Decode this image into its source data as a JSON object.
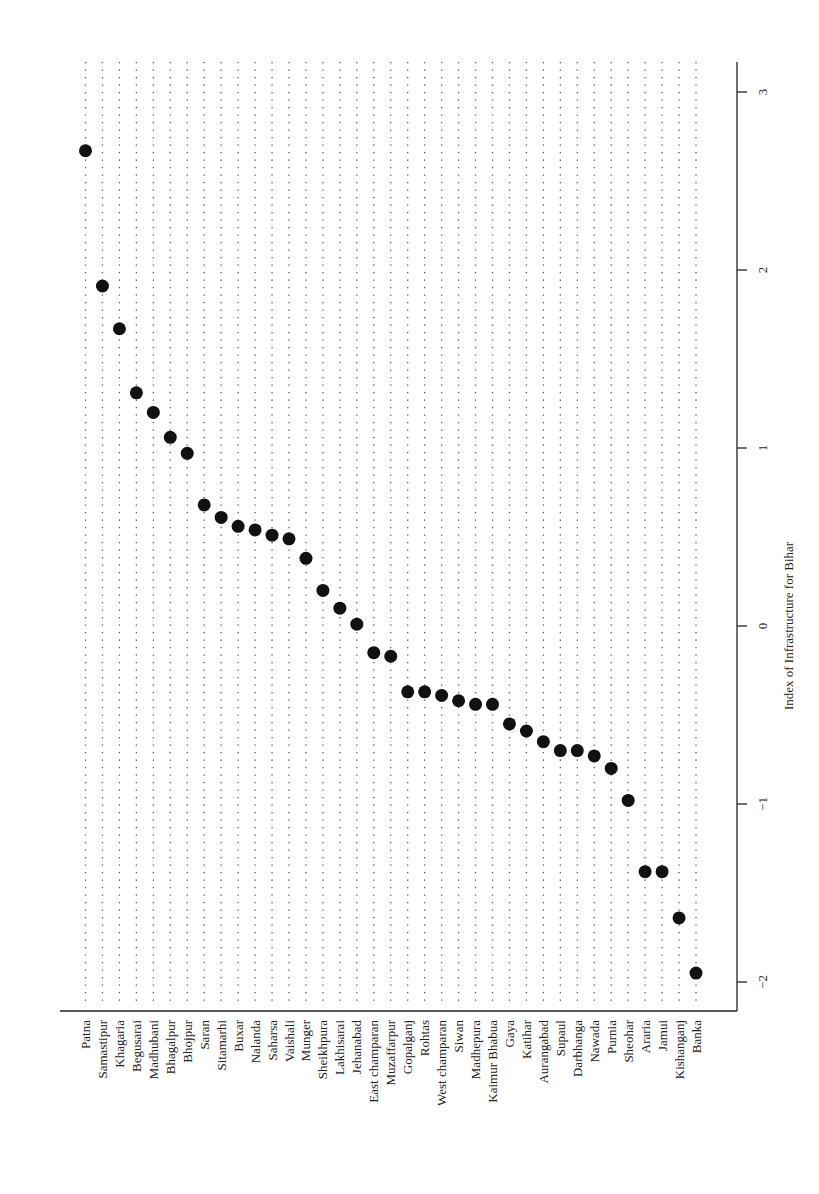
{
  "chart_data": {
    "type": "scatter",
    "subtype": "dot-plot",
    "orientation": "rotated-90",
    "title": "",
    "xlabel": "Index of Infrastructure for Bihar",
    "ylabel": "",
    "xlim": [
      -2.1,
      3.2
    ],
    "x_ticks": [
      -2,
      -1,
      0,
      1,
      2,
      3
    ],
    "x_tick_labels": [
      "−2",
      "−1",
      "0",
      "1",
      "2",
      "3"
    ],
    "grid": "dotted lines per category",
    "legend": null,
    "marker_color": "#111111",
    "categories": [
      "Patna",
      "Samastipur",
      "Khagaria",
      "Begusarai",
      "Madhubani",
      "Bhagalpur",
      "Bhojpur",
      "Saran",
      "Sitamarhi",
      "Buxar",
      "Nalanda",
      "Saharsa",
      "Vaishali",
      "Munger",
      "Sheikhpura",
      "Lakhisarai",
      "Jehanabad",
      "East champaran",
      "Muzaffarpur",
      "Gopalganj",
      "Rohtas",
      "West champaran",
      "Siwan",
      "Madhepura",
      "Kaimur Bhabua",
      "Gaya",
      "Katihar",
      "Aurangabad",
      "Supaul",
      "Darbhanga",
      "Nawada",
      "Purnia",
      "Sheohar",
      "Araria",
      "Jamui",
      "Kishanganj",
      "Banka"
    ],
    "values": [
      2.67,
      1.91,
      1.67,
      1.31,
      1.2,
      1.06,
      0.97,
      0.68,
      0.61,
      0.56,
      0.54,
      0.51,
      0.49,
      0.38,
      0.2,
      0.1,
      0.01,
      -0.15,
      -0.17,
      -0.37,
      -0.37,
      -0.39,
      -0.42,
      -0.44,
      -0.44,
      -0.55,
      -0.59,
      -0.65,
      -0.7,
      -0.7,
      -0.73,
      -0.8,
      -0.98,
      -1.38,
      -1.38,
      -1.64,
      -1.95
    ]
  }
}
